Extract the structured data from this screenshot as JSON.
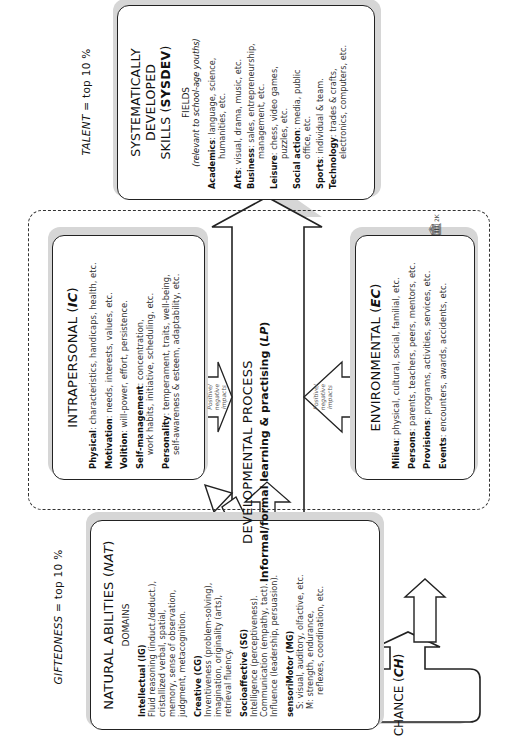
{
  "orientation": "rotated-90-ccw",
  "giftedness": {
    "caption_prefix": "GIFTEDNESS",
    "caption_suffix": " = top 10 %"
  },
  "talent": {
    "caption_prefix": "TALENT",
    "caption_suffix": " = top 10 %"
  },
  "nat": {
    "title": "NATURAL ABILITIES (",
    "title_abbr": "NAT",
    "title_close": ")",
    "subtitle": "DOMAINS",
    "domains": [
      {
        "name": "Intellectual (IG)",
        "lines": [
          "Fluid reasoning (induct./deduct.),",
          "cristallized verbal, spatial,",
          "memory, sense of observation,",
          "judgment, metacognition."
        ]
      },
      {
        "name": "Creative (CG)",
        "lines": [
          "Inventiveness (problem-solving),",
          "imagination, originality (arts),",
          "retrieval fluency."
        ]
      },
      {
        "name": "Socioaffective (SG)",
        "lines": [
          "Intelligence (perceptiveness).",
          "Communication (empathy, tact).",
          "Influence (leadership, persuasion)."
        ]
      },
      {
        "name": "sensoriMotor (MG)",
        "lines": [
          "S: visual, auditory, olfactive, etc.",
          "M: strength, endurance,",
          "reflexes, coordination, etc."
        ]
      }
    ]
  },
  "catalysts": {
    "label": "CATALYSTS"
  },
  "intrapersonal": {
    "title": "INTRAPERSONAL (",
    "title_abbr": "IC",
    "title_close": ")",
    "items": [
      {
        "key": "Physical",
        "text": ": characteristics, handicaps, health, etc."
      },
      {
        "key": "Motivation",
        "text": ": needs, interests, values, etc."
      },
      {
        "key": "Volition",
        "text": ": will-power, effort, persistence."
      },
      {
        "key": "Self-management",
        "text": ": concentration,",
        "cont": "work habits, initiative, scheduling, etc."
      },
      {
        "key": "Personality",
        "text": ": temperament, traits, well-being,",
        "cont": "self-awareness & esteem, adaptability, etc."
      }
    ],
    "impact_label": [
      "Positive/",
      "negative",
      "impacts"
    ]
  },
  "environmental": {
    "title": "ENVIRONMENTAL (",
    "title_abbr": "EC",
    "title_close": ")",
    "items": [
      {
        "key": "Milieu",
        "text": ": physical, cultural, social, familial, etc."
      },
      {
        "key": "Persons",
        "text": ": parents, teachers, peers, mentors, etc."
      },
      {
        "key": "Provisions",
        "text": ": programs, activities, services, etc."
      },
      {
        "key": "Events",
        "text": ": encounters, awards, accidents, etc."
      }
    ],
    "impact_label": [
      "Positive/",
      "negative",
      "impacts"
    ]
  },
  "developmental": {
    "title": "DEVELOPMENTAL PROCESS",
    "subtitle_prefix": "Informal/formal learning & practising (",
    "subtitle_abbr": "LP",
    "subtitle_close": ")"
  },
  "chance": {
    "title": "CHANCE (",
    "title_abbr": "CH",
    "title_close": ")"
  },
  "sysdev": {
    "title_line1": "SYSTEMATICALLY DEVELOPED",
    "title_line2": "SKILLS (",
    "title_abbr": "SYSDEV",
    "title_close": ")",
    "subtitle": "FIELDS",
    "subtitle_note": "(relevant to school-age youths)",
    "fields": [
      {
        "key": "Academics",
        "text": ": language, science,",
        "cont": "humanities, etc."
      },
      {
        "key": "Arts",
        "text": ": visual, drama, music, etc.",
        "cont": ""
      },
      {
        "key": "Business",
        "text": ": sales, entrepreneurship,",
        "cont": "management, etc."
      },
      {
        "key": "Leisure",
        "text": ": chess, video games,",
        "cont": "puzzles, etc."
      },
      {
        "key": "Social action",
        "text": ": media, public",
        "cont": "office, etc."
      },
      {
        "key": "Sports",
        "text": ": individual & team.",
        "cont": ""
      },
      {
        "key": "Technology",
        "text": ": trades & crafts,",
        "cont": "electronics, computers, etc."
      }
    ]
  },
  "logo": {
    "label": "2K"
  }
}
